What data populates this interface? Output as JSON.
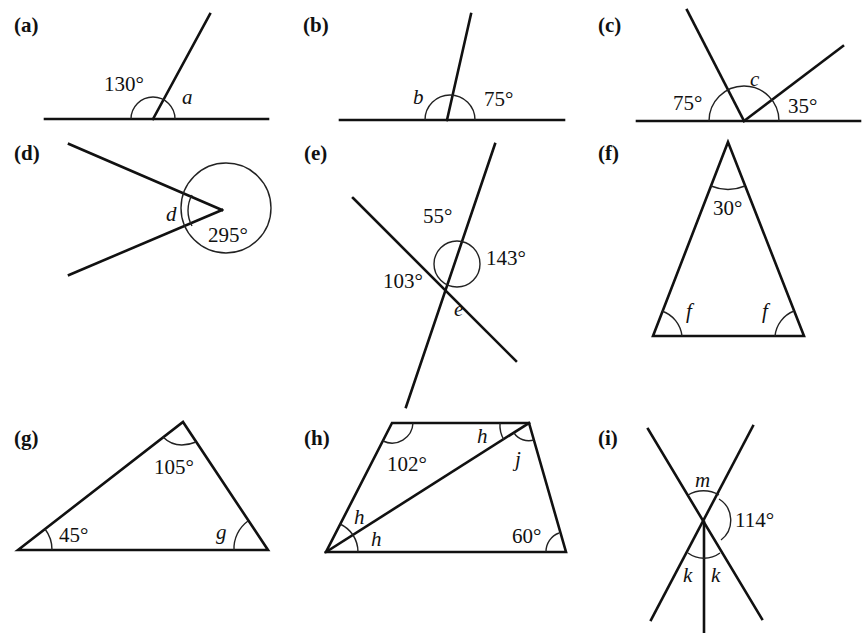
{
  "figure": {
    "type": "angle-exercises",
    "parts": [
      {
        "id": "a",
        "label": "(a)",
        "angles": {
          "given": "130°",
          "unknown": "a"
        }
      },
      {
        "id": "b",
        "label": "(b)",
        "angles": {
          "unknown": "b",
          "given": "75°"
        }
      },
      {
        "id": "c",
        "label": "(c)",
        "angles": {
          "left": "75°",
          "unknown": "c",
          "right": "35°"
        }
      },
      {
        "id": "d",
        "label": "(d)",
        "angles": {
          "unknown": "d",
          "reflex": "295°"
        }
      },
      {
        "id": "e",
        "label": "(e)",
        "angles": {
          "top": "55°",
          "right": "143°",
          "left": "103°",
          "unknown": "e"
        }
      },
      {
        "id": "f",
        "label": "(f)",
        "angles": {
          "apex": "30°",
          "base_left": "f",
          "base_right": "f"
        }
      },
      {
        "id": "g",
        "label": "(g)",
        "angles": {
          "apex": "105°",
          "left": "45°",
          "unknown": "g"
        }
      },
      {
        "id": "h",
        "label": "(h)",
        "angles": {
          "top_left": "102°",
          "top_right_h": "h",
          "top_right_j": "j",
          "left_upper": "h",
          "left_lower": "h",
          "bottom_right": "60°"
        }
      },
      {
        "id": "i",
        "label": "(i)",
        "angles": {
          "top": "m",
          "right": "114°",
          "bottom_left": "k",
          "bottom_right": "k"
        }
      }
    ]
  }
}
